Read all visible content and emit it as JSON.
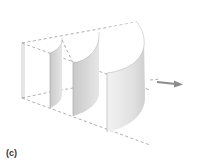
{
  "figure": {
    "caption": "(c)",
    "elements": [
      {
        "name": "shell-1",
        "label": "innermost half-cylinder shell"
      },
      {
        "name": "shell-2",
        "label": "middle half-cylinder shell"
      },
      {
        "name": "shell-3",
        "label": "outermost half-cylinder shell"
      }
    ],
    "arrow": {
      "direction": "right"
    },
    "colors": {
      "shell_fill": "#d4d4d4",
      "shell_shade": "#bdbdbd",
      "top_face": "#ffffff",
      "dash_line": "#9a9a9a",
      "arrow": "#8c8c8c",
      "caption": "#333333"
    }
  }
}
